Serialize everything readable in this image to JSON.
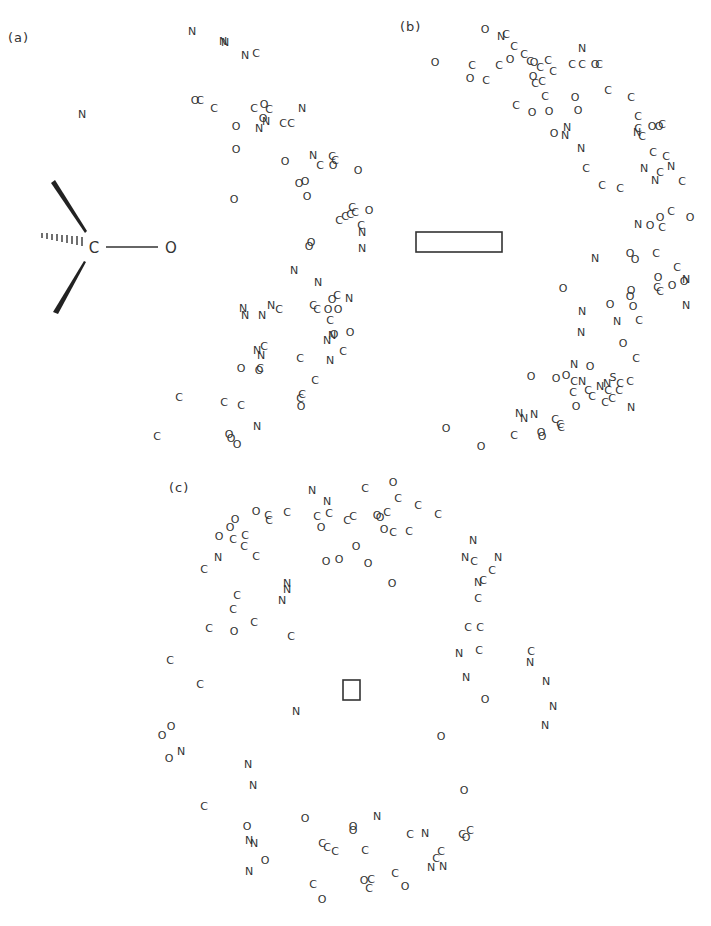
{
  "panels": [
    {
      "id": "a",
      "label": "(a)",
      "label_pos": [
        8,
        36
      ]
    },
    {
      "id": "b",
      "label": "(b)",
      "label_pos": [
        400,
        24
      ]
    },
    {
      "id": "c",
      "label": "(c)",
      "label_pos": [
        169,
        486
      ]
    }
  ],
  "inset_molecule": {
    "center_atom": "C",
    "center": [
      93,
      247
    ],
    "bonded_atom": "O",
    "bonded": [
      170,
      247
    ],
    "bond_types": [
      "wedge-up",
      "wedge-down",
      "hashed",
      "single"
    ]
  },
  "box_b": {
    "x": 416,
    "y": 232,
    "w": 86,
    "h": 20
  },
  "box_c": {
    "x": 343,
    "y": 680,
    "w": 17,
    "h": 20
  },
  "colors": {
    "ink": "#333333",
    "background": "#ffffff"
  },
  "atoms": [
    [
      "N",
      192,
      31
    ],
    [
      "N",
      223,
      41
    ],
    [
      "N",
      225,
      42
    ],
    [
      "N",
      245,
      55
    ],
    [
      "C",
      256,
      53
    ],
    [
      "N",
      82,
      114
    ],
    [
      "O",
      195,
      100
    ],
    [
      "C",
      200,
      100
    ],
    [
      "C",
      214,
      108
    ],
    [
      "C",
      254,
      108
    ],
    [
      "O",
      264,
      104
    ],
    [
      "C",
      269,
      109
    ],
    [
      "N",
      302,
      108
    ],
    [
      "O",
      236,
      126
    ],
    [
      "O",
      263,
      118
    ],
    [
      "N",
      259,
      128
    ],
    [
      "N",
      266,
      121
    ],
    [
      "C",
      283,
      123
    ],
    [
      "C",
      291,
      123
    ],
    [
      "O",
      236,
      149
    ],
    [
      "O",
      285,
      161
    ],
    [
      "N",
      313,
      155
    ],
    [
      "C",
      320,
      165
    ],
    [
      "C",
      332,
      156
    ],
    [
      "O",
      333,
      165
    ],
    [
      "C",
      335,
      160
    ],
    [
      "O",
      358,
      170
    ],
    [
      "O",
      299,
      183
    ],
    [
      "O",
      305,
      181
    ],
    [
      "O",
      307,
      196
    ],
    [
      "O",
      234,
      199
    ],
    [
      "C",
      339,
      220
    ],
    [
      "C",
      345,
      216
    ],
    [
      "C",
      350,
      214
    ],
    [
      "C",
      352,
      207
    ],
    [
      "C",
      355,
      212
    ],
    [
      "O",
      369,
      210
    ],
    [
      "C",
      361,
      225
    ],
    [
      "N",
      362,
      232
    ],
    [
      "N",
      362,
      248
    ],
    [
      "O",
      309,
      246
    ],
    [
      "O",
      311,
      242
    ],
    [
      "N",
      294,
      270
    ],
    [
      "N",
      318,
      282
    ],
    [
      "O",
      332,
      299
    ],
    [
      "C",
      337,
      295
    ],
    [
      "N",
      349,
      298
    ],
    [
      "N",
      243,
      308
    ],
    [
      "N",
      245,
      315
    ],
    [
      "N",
      262,
      315
    ],
    [
      "N",
      271,
      305
    ],
    [
      "C",
      279,
      309
    ],
    [
      "C",
      313,
      305
    ],
    [
      "C",
      317,
      309
    ],
    [
      "O",
      328,
      309
    ],
    [
      "O",
      338,
      309
    ],
    [
      "C",
      330,
      320
    ],
    [
      "N",
      327,
      340
    ],
    [
      "O",
      334,
      334
    ],
    [
      "N",
      332,
      335
    ],
    [
      "O",
      350,
      332
    ],
    [
      "C",
      343,
      351
    ],
    [
      "N",
      330,
      360
    ],
    [
      "N",
      257,
      350
    ],
    [
      "C",
      264,
      346
    ],
    [
      "N",
      261,
      355
    ],
    [
      "O",
      241,
      368
    ],
    [
      "C",
      260,
      368
    ],
    [
      "O",
      259,
      370
    ],
    [
      "C",
      300,
      358
    ],
    [
      "C",
      315,
      380
    ],
    [
      "C",
      302,
      394
    ],
    [
      "C",
      300,
      398
    ],
    [
      "O",
      301,
      406
    ],
    [
      "C",
      179,
      397
    ],
    [
      "C",
      224,
      402
    ],
    [
      "C",
      241,
      405
    ],
    [
      "N",
      257,
      426
    ],
    [
      "C",
      157,
      436
    ],
    [
      "O",
      229,
      434
    ],
    [
      "O",
      231,
      438
    ],
    [
      "O",
      237,
      444
    ],
    [
      "O",
      485,
      29
    ],
    [
      "N",
      501,
      36
    ],
    [
      "C",
      506,
      34
    ],
    [
      "C",
      514,
      46
    ],
    [
      "O",
      435,
      62
    ],
    [
      "C",
      472,
      65
    ],
    [
      "O",
      470,
      78
    ],
    [
      "C",
      486,
      80
    ],
    [
      "C",
      499,
      65
    ],
    [
      "O",
      510,
      59
    ],
    [
      "C",
      524,
      54
    ],
    [
      "C",
      530,
      61
    ],
    [
      "O",
      534,
      62
    ],
    [
      "C",
      540,
      67
    ],
    [
      "C",
      548,
      60
    ],
    [
      "C",
      553,
      71
    ],
    [
      "N",
      582,
      48
    ],
    [
      "C",
      572,
      64
    ],
    [
      "C",
      582,
      64
    ],
    [
      "O",
      595,
      64
    ],
    [
      "C",
      599,
      64
    ],
    [
      "O",
      533,
      76
    ],
    [
      "C",
      535,
      83
    ],
    [
      "C",
      542,
      81
    ],
    [
      "C",
      545,
      96
    ],
    [
      "C",
      608,
      90
    ],
    [
      "C",
      631,
      97
    ],
    [
      "O",
      575,
      97
    ],
    [
      "C",
      516,
      105
    ],
    [
      "O",
      532,
      112
    ],
    [
      "O",
      549,
      111
    ],
    [
      "O",
      578,
      110
    ],
    [
      "O",
      554,
      133
    ],
    [
      "N",
      567,
      127
    ],
    [
      "N",
      565,
      135
    ],
    [
      "N",
      581,
      148
    ],
    [
      "C",
      586,
      168
    ],
    [
      "C",
      602,
      185
    ],
    [
      "C",
      620,
      188
    ],
    [
      "C",
      638,
      116
    ],
    [
      "C",
      638,
      128
    ],
    [
      "N",
      637,
      132
    ],
    [
      "C",
      642,
      136
    ],
    [
      "O",
      652,
      126
    ],
    [
      "O",
      659,
      126
    ],
    [
      "C",
      662,
      124
    ],
    [
      "C",
      653,
      152
    ],
    [
      "C",
      666,
      156
    ],
    [
      "N",
      644,
      168
    ],
    [
      "C",
      660,
      172
    ],
    [
      "N",
      655,
      180
    ],
    [
      "N",
      671,
      166
    ],
    [
      "C",
      682,
      181
    ],
    [
      "N",
      638,
      224
    ],
    [
      "O",
      650,
      225
    ],
    [
      "O",
      660,
      217
    ],
    [
      "C",
      662,
      227
    ],
    [
      "C",
      671,
      211
    ],
    [
      "O",
      690,
      217
    ],
    [
      "N",
      595,
      258
    ],
    [
      "O",
      630,
      253
    ],
    [
      "O",
      635,
      259
    ],
    [
      "C",
      656,
      253
    ],
    [
      "O",
      563,
      288
    ],
    [
      "O",
      631,
      290
    ],
    [
      "O",
      630,
      296
    ],
    [
      "O",
      658,
      277
    ],
    [
      "C",
      677,
      267
    ],
    [
      "C",
      657,
      287
    ],
    [
      "C",
      660,
      291
    ],
    [
      "O",
      672,
      285
    ],
    [
      "O",
      684,
      281
    ],
    [
      "N",
      686,
      279
    ],
    [
      "N",
      686,
      305
    ],
    [
      "N",
      582,
      311
    ],
    [
      "O",
      610,
      304
    ],
    [
      "O",
      633,
      306
    ],
    [
      "N",
      617,
      321
    ],
    [
      "C",
      639,
      320
    ],
    [
      "N",
      581,
      332
    ],
    [
      "O",
      623,
      343
    ],
    [
      "C",
      636,
      358
    ],
    [
      "N",
      574,
      364
    ],
    [
      "O",
      590,
      366
    ],
    [
      "O",
      531,
      376
    ],
    [
      "O",
      556,
      378
    ],
    [
      "O",
      566,
      375
    ],
    [
      "C",
      574,
      381
    ],
    [
      "N",
      582,
      381
    ],
    [
      "C",
      573,
      392
    ],
    [
      "C",
      588,
      390
    ],
    [
      "C",
      592,
      396
    ],
    [
      "N",
      600,
      386
    ],
    [
      "N",
      607,
      383
    ],
    [
      "C",
      608,
      390
    ],
    [
      "S",
      613,
      377
    ],
    [
      "C",
      620,
      383
    ],
    [
      "C",
      630,
      381
    ],
    [
      "C",
      619,
      390
    ],
    [
      "C",
      605,
      402
    ],
    [
      "C",
      612,
      398
    ],
    [
      "O",
      576,
      406
    ],
    [
      "N",
      631,
      407
    ],
    [
      "N",
      519,
      413
    ],
    [
      "N",
      524,
      418
    ],
    [
      "N",
      534,
      414
    ],
    [
      "C",
      555,
      419
    ],
    [
      "C",
      561,
      427
    ],
    [
      "O",
      446,
      428
    ],
    [
      "C",
      514,
      435
    ],
    [
      "O",
      541,
      432
    ],
    [
      "O",
      542,
      436
    ],
    [
      "C",
      560,
      424
    ],
    [
      "O",
      481,
      446
    ],
    [
      "C",
      365,
      488
    ],
    [
      "O",
      393,
      482
    ],
    [
      "N",
      312,
      490
    ],
    [
      "N",
      327,
      501
    ],
    [
      "C",
      398,
      498
    ],
    [
      "C",
      418,
      505
    ],
    [
      "C",
      438,
      514
    ],
    [
      "O",
      256,
      511
    ],
    [
      "C",
      268,
      515
    ],
    [
      "C",
      269,
      520
    ],
    [
      "C",
      287,
      512
    ],
    [
      "O",
      235,
      519
    ],
    [
      "O",
      230,
      527
    ],
    [
      "O",
      219,
      536
    ],
    [
      "C",
      233,
      539
    ],
    [
      "C",
      245,
      535
    ],
    [
      "C",
      244,
      546
    ],
    [
      "C",
      256,
      556
    ],
    [
      "N",
      218,
      557
    ],
    [
      "C",
      204,
      569
    ],
    [
      "C",
      317,
      516
    ],
    [
      "C",
      329,
      513
    ],
    [
      "O",
      321,
      527
    ],
    [
      "C",
      347,
      520
    ],
    [
      "C",
      353,
      516
    ],
    [
      "O",
      377,
      515
    ],
    [
      "O",
      380,
      517
    ],
    [
      "C",
      387,
      512
    ],
    [
      "O",
      384,
      529
    ],
    [
      "C",
      393,
      532
    ],
    [
      "C",
      409,
      531
    ],
    [
      "O",
      356,
      546
    ],
    [
      "O",
      326,
      561
    ],
    [
      "O",
      339,
      559
    ],
    [
      "O",
      368,
      563
    ],
    [
      "O",
      392,
      583
    ],
    [
      "N",
      287,
      583
    ],
    [
      "N",
      287,
      589
    ],
    [
      "N",
      282,
      600
    ],
    [
      "C",
      237,
      595
    ],
    [
      "C",
      233,
      609
    ],
    [
      "C",
      209,
      628
    ],
    [
      "O",
      234,
      631
    ],
    [
      "C",
      254,
      622
    ],
    [
      "C",
      291,
      636
    ],
    [
      "N",
      473,
      540
    ],
    [
      "N",
      465,
      557
    ],
    [
      "C",
      474,
      561
    ],
    [
      "N",
      498,
      557
    ],
    [
      "C",
      492,
      570
    ],
    [
      "N",
      478,
      582
    ],
    [
      "C",
      483,
      580
    ],
    [
      "C",
      478,
      598
    ],
    [
      "C",
      468,
      627
    ],
    [
      "C",
      480,
      627
    ],
    [
      "C",
      479,
      650
    ],
    [
      "N",
      459,
      653
    ],
    [
      "N",
      466,
      677
    ],
    [
      "O",
      485,
      699
    ],
    [
      "C",
      531,
      651
    ],
    [
      "N",
      530,
      662
    ],
    [
      "N",
      546,
      681
    ],
    [
      "N",
      553,
      706
    ],
    [
      "N",
      545,
      725
    ],
    [
      "C",
      170,
      660
    ],
    [
      "C",
      200,
      684
    ],
    [
      "N",
      296,
      711
    ],
    [
      "O",
      171,
      726
    ],
    [
      "O",
      162,
      735
    ],
    [
      "O",
      169,
      758
    ],
    [
      "N",
      181,
      751
    ],
    [
      "N",
      248,
      764
    ],
    [
      "N",
      253,
      785
    ],
    [
      "O",
      441,
      736
    ],
    [
      "C",
      204,
      806
    ],
    [
      "O",
      464,
      790
    ],
    [
      "O",
      247,
      826
    ],
    [
      "N",
      249,
      840
    ],
    [
      "N",
      254,
      843
    ],
    [
      "O",
      265,
      860
    ],
    [
      "N",
      249,
      871
    ],
    [
      "O",
      305,
      818
    ],
    [
      "O",
      353,
      826
    ],
    [
      "O",
      353,
      830
    ],
    [
      "N",
      377,
      816
    ],
    [
      "C",
      322,
      843
    ],
    [
      "C",
      327,
      847
    ],
    [
      "C",
      335,
      851
    ],
    [
      "C",
      365,
      850
    ],
    [
      "C",
      410,
      834
    ],
    [
      "N",
      425,
      833
    ],
    [
      "C",
      462,
      834
    ],
    [
      "C",
      470,
      830
    ],
    [
      "O",
      466,
      837
    ],
    [
      "C",
      441,
      851
    ],
    [
      "C",
      436,
      858
    ],
    [
      "N",
      431,
      867
    ],
    [
      "N",
      443,
      866
    ],
    [
      "C",
      313,
      884
    ],
    [
      "O",
      322,
      899
    ],
    [
      "O",
      364,
      880
    ],
    [
      "C",
      371,
      879
    ],
    [
      "C",
      369,
      888
    ],
    [
      "C",
      395,
      873
    ],
    [
      "O",
      405,
      886
    ]
  ]
}
